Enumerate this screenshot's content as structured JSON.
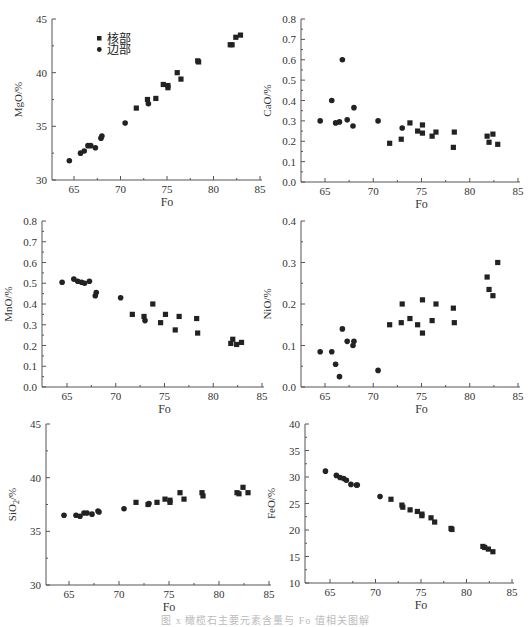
{
  "legend": {
    "core": "核部",
    "rim": "边部"
  },
  "caption": "图 x   橄榄石主要元素含量与 Fo 值相关图解",
  "chart_data": [
    {
      "type": "scatter",
      "id": "mgo",
      "title": "",
      "xlabel": "Fo",
      "ylabel": "MgO/%",
      "xlim": [
        62.5,
        85
      ],
      "ylim": [
        30,
        45
      ],
      "xticks": [
        65,
        70,
        75,
        80,
        85
      ],
      "yticks": [
        30,
        35,
        40,
        45
      ],
      "frame": {
        "x0": 52,
        "x1": 262,
        "y0": 180,
        "y1": 19,
        "xtick0": 74,
        "xtick1": 260
      },
      "series": [
        {
          "name": "核部",
          "marker": "square",
          "points": [
            [
              71.7,
              36.7
            ],
            [
              72.9,
              37.5
            ],
            [
              73.8,
              37.6
            ],
            [
              74.6,
              38.9
            ],
            [
              75.1,
              38.8
            ],
            [
              75.1,
              38.6
            ],
            [
              76.1,
              40.0
            ],
            [
              76.5,
              39.4
            ],
            [
              78.3,
              41.1
            ],
            [
              78.4,
              41.0
            ],
            [
              81.8,
              42.6
            ],
            [
              82.0,
              42.6
            ],
            [
              82.4,
              43.3
            ],
            [
              82.9,
              43.5
            ]
          ]
        },
        {
          "name": "边部",
          "marker": "circle",
          "points": [
            [
              64.5,
              31.8
            ],
            [
              65.7,
              32.5
            ],
            [
              66.1,
              32.7
            ],
            [
              66.5,
              33.2
            ],
            [
              66.8,
              33.2
            ],
            [
              67.3,
              33.0
            ],
            [
              67.9,
              33.9
            ],
            [
              68.0,
              34.1
            ],
            [
              70.5,
              35.3
            ],
            [
              73.0,
              37.1
            ]
          ]
        }
      ]
    },
    {
      "type": "scatter",
      "id": "cao",
      "title": "",
      "xlabel": "Fo",
      "ylabel": "CaO/%",
      "xlim": [
        62.5,
        85
      ],
      "ylim": [
        0,
        0.8
      ],
      "xticks": [
        65,
        70,
        75,
        80,
        85
      ],
      "yticks": [
        0.0,
        0.1,
        0.2,
        0.3,
        0.4,
        0.5,
        0.6,
        0.7,
        0.8
      ],
      "frame": {
        "x0": 301,
        "x1": 520,
        "y0": 182,
        "y1": 19,
        "xtick0": 325,
        "xtick1": 518
      },
      "series": [
        {
          "name": "核部",
          "marker": "square",
          "points": [
            [
              71.7,
              0.19
            ],
            [
              72.9,
              0.21
            ],
            [
              73.8,
              0.29
            ],
            [
              74.6,
              0.25
            ],
            [
              75.1,
              0.28
            ],
            [
              75.1,
              0.24
            ],
            [
              76.1,
              0.225
            ],
            [
              76.5,
              0.245
            ],
            [
              78.3,
              0.17
            ],
            [
              78.4,
              0.245
            ],
            [
              81.8,
              0.225
            ],
            [
              82.0,
              0.195
            ],
            [
              82.4,
              0.235
            ],
            [
              82.9,
              0.185
            ]
          ]
        },
        {
          "name": "边部",
          "marker": "circle",
          "points": [
            [
              64.5,
              0.3
            ],
            [
              65.7,
              0.4
            ],
            [
              66.1,
              0.29
            ],
            [
              66.5,
              0.295
            ],
            [
              66.8,
              0.6
            ],
            [
              67.3,
              0.305
            ],
            [
              67.9,
              0.275
            ],
            [
              68.0,
              0.365
            ],
            [
              70.5,
              0.3
            ],
            [
              73.0,
              0.265
            ]
          ]
        }
      ]
    },
    {
      "type": "scatter",
      "id": "mno",
      "title": "",
      "xlabel": "Fo",
      "ylabel": "MnO/%",
      "xlim": [
        62.5,
        85
      ],
      "ylim": [
        0,
        0.8
      ],
      "xticks": [
        65,
        70,
        75,
        80,
        85
      ],
      "yticks": [
        0.0,
        0.1,
        0.2,
        0.3,
        0.4,
        0.5,
        0.6,
        0.7,
        0.8
      ],
      "frame": {
        "x0": 42,
        "x1": 264,
        "y0": 387,
        "y1": 221,
        "xtick0": 67,
        "xtick1": 262
      },
      "series": [
        {
          "name": "核部",
          "marker": "square",
          "points": [
            [
              71.7,
              0.35
            ],
            [
              72.9,
              0.34
            ],
            [
              73.8,
              0.4
            ],
            [
              74.6,
              0.31
            ],
            [
              75.1,
              0.35
            ],
            [
              76.1,
              0.275
            ],
            [
              76.5,
              0.34
            ],
            [
              78.3,
              0.33
            ],
            [
              78.4,
              0.26
            ],
            [
              81.8,
              0.21
            ],
            [
              82.0,
              0.23
            ],
            [
              82.4,
              0.205
            ],
            [
              82.9,
              0.215
            ]
          ]
        },
        {
          "name": "边部",
          "marker": "circle",
          "points": [
            [
              64.5,
              0.505
            ],
            [
              65.7,
              0.52
            ],
            [
              66.1,
              0.51
            ],
            [
              66.5,
              0.505
            ],
            [
              66.8,
              0.5
            ],
            [
              67.3,
              0.51
            ],
            [
              67.9,
              0.44
            ],
            [
              68.0,
              0.455
            ],
            [
              70.5,
              0.43
            ],
            [
              73.0,
              0.32
            ]
          ]
        }
      ]
    },
    {
      "type": "scatter",
      "id": "nio",
      "title": "",
      "xlabel": "Fo",
      "ylabel": "NiO/%",
      "xlim": [
        62.5,
        85
      ],
      "ylim": [
        0,
        0.4
      ],
      "xticks": [
        65,
        70,
        75,
        80,
        85
      ],
      "yticks": [
        0.0,
        0.1,
        0.2,
        0.3,
        0.4
      ],
      "frame": {
        "x0": 301,
        "x1": 520,
        "y0": 387,
        "y1": 221,
        "xtick0": 325,
        "xtick1": 518
      },
      "series": [
        {
          "name": "核部",
          "marker": "square",
          "points": [
            [
              71.7,
              0.15
            ],
            [
              72.9,
              0.155
            ],
            [
              73.0,
              0.2
            ],
            [
              73.8,
              0.165
            ],
            [
              74.6,
              0.15
            ],
            [
              75.1,
              0.21
            ],
            [
              75.1,
              0.13
            ],
            [
              76.1,
              0.16
            ],
            [
              76.5,
              0.2
            ],
            [
              78.3,
              0.19
            ],
            [
              78.4,
              0.155
            ],
            [
              81.8,
              0.265
            ],
            [
              82.0,
              0.235
            ],
            [
              82.4,
              0.22
            ],
            [
              82.9,
              0.3
            ]
          ]
        },
        {
          "name": "边部",
          "marker": "circle",
          "points": [
            [
              64.5,
              0.085
            ],
            [
              65.7,
              0.085
            ],
            [
              66.1,
              0.055
            ],
            [
              66.5,
              0.025
            ],
            [
              66.8,
              0.14
            ],
            [
              67.3,
              0.11
            ],
            [
              67.9,
              0.1
            ],
            [
              68.0,
              0.11
            ],
            [
              70.5,
              0.04
            ]
          ]
        }
      ]
    },
    {
      "type": "scatter",
      "id": "sio2",
      "title": "",
      "xlabel": "Fo",
      "ylabel": "SiO2/%",
      "xlim": [
        62.5,
        85
      ],
      "ylim": [
        30,
        45
      ],
      "xticks": [
        65,
        70,
        75,
        80,
        85
      ],
      "yticks": [
        30,
        35,
        40,
        45
      ],
      "frame": {
        "x0": 46,
        "x1": 271,
        "y0": 585,
        "y1": 424,
        "xtick0": 69,
        "xtick1": 269
      },
      "series": [
        {
          "name": "核部",
          "marker": "square",
          "points": [
            [
              71.7,
              37.7
            ],
            [
              72.9,
              37.5
            ],
            [
              73.8,
              37.7
            ],
            [
              74.6,
              38.0
            ],
            [
              75.1,
              37.9
            ],
            [
              75.1,
              37.7
            ],
            [
              76.1,
              38.6
            ],
            [
              76.5,
              38.0
            ],
            [
              78.3,
              38.6
            ],
            [
              78.4,
              38.3
            ],
            [
              81.8,
              38.6
            ],
            [
              82.0,
              38.5
            ],
            [
              82.4,
              39.1
            ],
            [
              82.9,
              38.6
            ]
          ]
        },
        {
          "name": "边部",
          "marker": "circle",
          "points": [
            [
              64.5,
              36.5
            ],
            [
              65.7,
              36.5
            ],
            [
              66.1,
              36.4
            ],
            [
              66.5,
              36.7
            ],
            [
              66.8,
              36.7
            ],
            [
              67.3,
              36.6
            ],
            [
              67.9,
              36.9
            ],
            [
              68.0,
              36.8
            ],
            [
              70.5,
              37.1
            ],
            [
              73.0,
              37.6
            ]
          ]
        }
      ]
    },
    {
      "type": "scatter",
      "id": "feo",
      "title": "",
      "xlabel": "Fo",
      "ylabel": "FeO/%",
      "xlim": [
        62.5,
        85
      ],
      "ylim": [
        10,
        40
      ],
      "xticks": [
        65,
        70,
        75,
        80,
        85
      ],
      "yticks": [
        10,
        15,
        20,
        25,
        30,
        35,
        40
      ],
      "frame": {
        "x0": 305,
        "x1": 514,
        "y0": 583,
        "y1": 424,
        "xtick0": 330,
        "xtick1": 512
      },
      "series": [
        {
          "name": "核部",
          "marker": "square",
          "points": [
            [
              71.7,
              25.8
            ],
            [
              72.9,
              24.7
            ],
            [
              73.0,
              24.3
            ],
            [
              73.8,
              23.8
            ],
            [
              74.6,
              23.5
            ],
            [
              75.1,
              23.0
            ],
            [
              75.1,
              22.7
            ],
            [
              76.1,
              22.3
            ],
            [
              76.5,
              21.5
            ],
            [
              78.3,
              20.3
            ],
            [
              78.4,
              20.1
            ],
            [
              81.8,
              16.9
            ],
            [
              82.0,
              16.7
            ],
            [
              82.4,
              16.4
            ],
            [
              82.9,
              15.9
            ]
          ]
        },
        {
          "name": "边部",
          "marker": "circle",
          "points": [
            [
              64.5,
              31.1
            ],
            [
              65.7,
              30.3
            ],
            [
              66.1,
              29.9
            ],
            [
              66.5,
              29.7
            ],
            [
              66.8,
              29.4
            ],
            [
              67.3,
              28.6
            ],
            [
              67.9,
              28.5
            ],
            [
              68.0,
              28.5
            ],
            [
              70.5,
              26.3
            ]
          ]
        }
      ]
    }
  ]
}
